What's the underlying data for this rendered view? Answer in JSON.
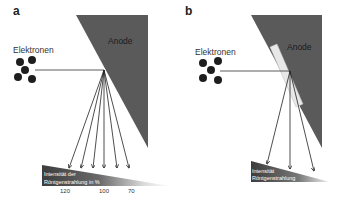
{
  "panels": [
    {
      "id": "a",
      "label": "a",
      "electrons_label": "Elektronen",
      "anode_label": "Anode",
      "wedge_label_line1": "Intensität der",
      "wedge_label_line2": "Röntgenstrahlung in %",
      "ticks": [
        "120",
        "100",
        "70"
      ],
      "ray_count": 6
    },
    {
      "id": "b",
      "label": "b",
      "electrons_label": "Elektronen",
      "anode_label": "Anode",
      "wedge_label_line1": "Intensität",
      "wedge_label_line2": "Röntgenstrahlung",
      "ray_count": 3,
      "has_filter_strip": true
    }
  ],
  "colors": {
    "anode": "#5a5a5a",
    "electron": "#1e1e1e",
    "wedge_dark": "#4a4a4a",
    "line": "#333333",
    "filter_strip": "#e8e8e8"
  }
}
